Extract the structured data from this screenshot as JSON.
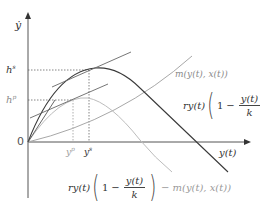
{
  "diagram": {
    "axes": {
      "y_label": "ẏ",
      "x_label": "y(t)",
      "origin_label": "0"
    },
    "y_ticks": [
      {
        "label_base": "h",
        "label_sup": "s",
        "y_px": 70
      },
      {
        "label_base": "h",
        "label_sup": "p",
        "y_px": 100
      }
    ],
    "x_ticks": [
      {
        "label_base": "y",
        "label_sup": "p",
        "x_px": 72
      },
      {
        "label_base": "y",
        "label_sup": "s",
        "x_px": 88
      }
    ],
    "curves": {
      "growth": {
        "name": "logistic growth",
        "color": "#3a3a3a",
        "label_prefix": "ry(t)",
        "label_one": "1",
        "label_minus": "−",
        "label_num": "y(t)",
        "label_den": "k"
      },
      "harvest": {
        "name": "harvest function",
        "color": "#9a9a9a",
        "label": "m(y(t), x(t))"
      },
      "net": {
        "name": "net growth",
        "color": "#bdbdbd",
        "label_prefix": "ry(t)",
        "label_one": "1",
        "label_minus": "−",
        "label_num": "y(t)",
        "label_den": "k",
        "label_tail": "− m(y(t), x(t))"
      }
    },
    "tangent_lines": [
      {
        "touches": "growth peak at y^s",
        "color": "#555555"
      },
      {
        "touches": "net curve at y^p",
        "color": "#555555"
      }
    ]
  }
}
